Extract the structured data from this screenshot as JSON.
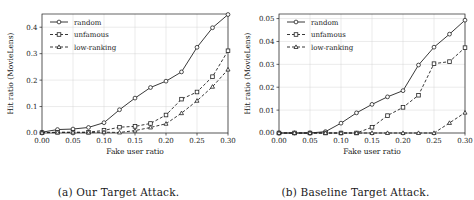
{
  "figure": {
    "panels": [
      {
        "caption": "(a) Our Target Attack.",
        "chart_data": {
          "type": "line",
          "title": "",
          "xlabel": "Fake user ratio",
          "ylabel": "Hit ratio (MovieLens)",
          "xlim": [
            0.0,
            0.3
          ],
          "ylim": [
            0.0,
            0.45
          ],
          "xticks": [
            "0.00",
            "0.05",
            "0.10",
            "0.15",
            "0.20",
            "0.25",
            "0.30"
          ],
          "xtick_values": [
            0.0,
            0.05,
            0.1,
            0.15,
            0.2,
            0.25,
            0.3
          ],
          "yticks": [
            "0.0",
            "0.1",
            "0.2",
            "0.3",
            "0.4"
          ],
          "ytick_values": [
            0.0,
            0.1,
            0.2,
            0.3,
            0.4
          ],
          "grid": true,
          "legend_position": "upper left",
          "x": [
            0.0,
            0.025,
            0.05,
            0.075,
            0.1,
            0.125,
            0.15,
            0.175,
            0.2,
            0.225,
            0.25,
            0.275,
            0.3
          ],
          "series": [
            {
              "name": "random",
              "marker": "circle",
              "linestyle": "solid",
              "color": "#222222",
              "values": [
                0.003,
                0.013,
                0.015,
                0.021,
                0.039,
                0.088,
                0.132,
                0.172,
                0.196,
                0.231,
                0.324,
                0.398,
                0.448
              ]
            },
            {
              "name": "unfamous",
              "marker": "square",
              "linestyle": "dashed",
              "color": "#222222",
              "values": [
                0.001,
                0.003,
                0.003,
                0.003,
                0.01,
                0.022,
                0.025,
                0.036,
                0.068,
                0.128,
                0.155,
                0.213,
                0.311
              ]
            },
            {
              "name": "low-ranking",
              "marker": "triangle",
              "linestyle": "dashed",
              "color": "#222222",
              "values": [
                0.001,
                0.002,
                0.002,
                0.002,
                0.003,
                0.002,
                0.009,
                0.021,
                0.035,
                0.075,
                0.122,
                0.175,
                0.24
              ]
            }
          ]
        }
      },
      {
        "caption": "(b) Baseline Target Attack.",
        "chart_data": {
          "type": "line",
          "title": "",
          "xlabel": "Fake user ratio",
          "ylabel": "Hit ratio (MovieLens)",
          "xlim": [
            0.0,
            0.3
          ],
          "ylim": [
            0.0,
            0.052
          ],
          "xticks": [
            "0.00",
            "0.05",
            "0.10",
            "0.15",
            "0.20",
            "0.25",
            "0.30"
          ],
          "xtick_values": [
            0.0,
            0.05,
            0.1,
            0.15,
            0.2,
            0.25,
            0.3
          ],
          "yticks": [
            "0.00",
            "0.01",
            "0.02",
            "0.03",
            "0.04",
            "0.05"
          ],
          "ytick_values": [
            0.0,
            0.01,
            0.02,
            0.03,
            0.04,
            0.05
          ],
          "grid": true,
          "legend_position": "upper left",
          "x": [
            0.0,
            0.025,
            0.05,
            0.075,
            0.1,
            0.125,
            0.15,
            0.175,
            0.2,
            0.225,
            0.25,
            0.275,
            0.3
          ],
          "series": [
            {
              "name": "random",
              "marker": "circle",
              "linestyle": "solid",
              "color": "#222222",
              "values": [
                0.0,
                0.0,
                0.0,
                0.0006,
                0.0043,
                0.0088,
                0.0125,
                0.0158,
                0.0185,
                0.0297,
                0.0375,
                0.0432,
                0.0493
              ]
            },
            {
              "name": "unfamous",
              "marker": "square",
              "linestyle": "dashed",
              "color": "#222222",
              "values": [
                0.0,
                0.0,
                0.0,
                0.0,
                0.0,
                0.0,
                0.0025,
                0.0076,
                0.0112,
                0.0165,
                0.0303,
                0.0312,
                0.0373
              ]
            },
            {
              "name": "low-ranking",
              "marker": "triangle",
              "linestyle": "dashed",
              "color": "#222222",
              "values": [
                0.0,
                0.0,
                0.0,
                0.0,
                0.0,
                0.0,
                0.0,
                0.0,
                0.0,
                0.0,
                0.0,
                0.0044,
                0.0089
              ]
            }
          ]
        }
      }
    ]
  }
}
